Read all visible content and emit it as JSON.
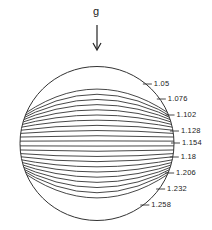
{
  "figure": {
    "gravity_label": "g",
    "gravity_arrow": "down-arrow",
    "circle": {
      "cx": 97,
      "cy": 143.5,
      "r": 77
    },
    "contour_labels": [
      {
        "value": "1.05",
        "y": 84
      },
      {
        "value": "1.076",
        "y": 99
      },
      {
        "value": "1.102",
        "y": 115
      },
      {
        "value": "1.128",
        "y": 131
      },
      {
        "value": "1.154",
        "y": 143
      },
      {
        "value": "1.18",
        "y": 157
      },
      {
        "value": "1.206",
        "y": 173
      },
      {
        "value": "1.232",
        "y": 189
      },
      {
        "value": "1.258",
        "y": 205
      }
    ],
    "line_color": "#333333"
  }
}
